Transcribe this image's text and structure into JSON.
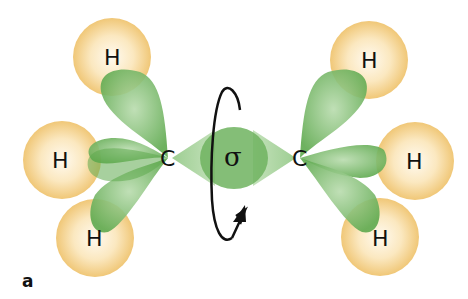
{
  "diagram": {
    "panel_label": "a",
    "bond_label": "σ",
    "colors": {
      "hydrogen": "#f2cf8a",
      "hydrogen_center": "#fffaf0",
      "orbital": "#6fb35f",
      "orbital_light": "#b9dcae",
      "arrow": "#111111"
    },
    "left_carbon": {
      "label": "C",
      "hydrogens": [
        "H",
        "H",
        "H"
      ]
    },
    "right_carbon": {
      "label": "C",
      "hydrogens": [
        "H",
        "H",
        "H"
      ]
    },
    "rotation_arrow": "rotation-about-sigma-bond"
  }
}
